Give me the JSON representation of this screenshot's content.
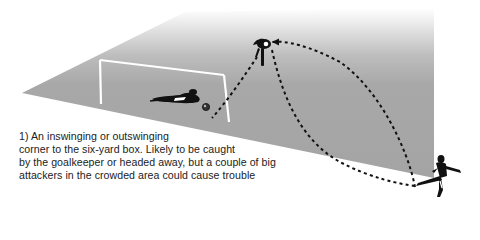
{
  "diagram": {
    "type": "football set-piece tactic illustration",
    "pitch": {
      "fill_color": "#a6a6a6",
      "fade_to": "#ffffff",
      "line_color": "#ffffff"
    },
    "goal": {
      "label": "goal",
      "color": "#ffffff"
    },
    "players": [
      {
        "role": "goalkeeper",
        "pose": "diving"
      },
      {
        "role": "attacker",
        "pose": "heading"
      },
      {
        "role": "corner taker",
        "pose": "kicking"
      }
    ],
    "ball": {
      "label": "ball"
    },
    "trajectories": [
      {
        "from": "corner taker",
        "to": "attacker",
        "style": "dashed",
        "curve": "outswinging arc"
      },
      {
        "from": "corner taker",
        "to": "attacker",
        "style": "dashed",
        "curve": "inswinging arc"
      },
      {
        "from": "attacker",
        "to": "ball",
        "style": "dashed",
        "curve": "header"
      }
    ],
    "trajectory_color": "#111111"
  },
  "caption": {
    "lines": [
      "1) An inswinging or outswinging",
      "corner to the six-yard box. Likely to be caught",
      "by the goalkeeper or headed away, but a couple of big",
      "attackers in the crowded area could cause trouble"
    ]
  }
}
